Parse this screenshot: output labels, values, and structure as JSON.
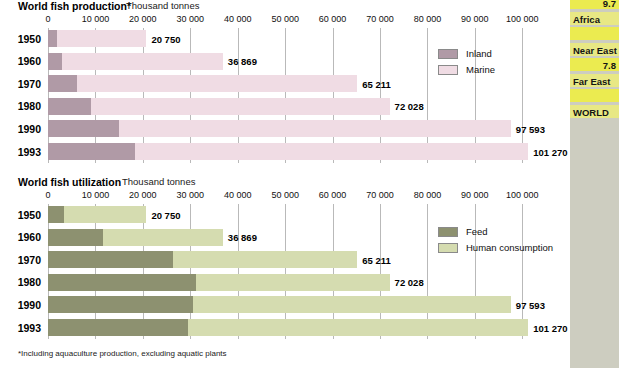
{
  "colors": {
    "inland": "#b09aa6",
    "marine": "#f0dce4",
    "feed": "#8d9170",
    "human_consumption": "#d5dcb0",
    "gridline": "#b9b9b9",
    "side_strip_bg": "#cdcdc0",
    "side_band": "#e8e884",
    "side_band_bright": "#ebeb50"
  },
  "footnote": "*Including aquaculture production, excluding aquatic plants",
  "axis": {
    "ticks": [
      "0",
      "10 000",
      "20 000",
      "30 000",
      "40 000",
      "50 000",
      "60 000",
      "70 000",
      "80 000",
      "90 000",
      "100 000"
    ],
    "min": 0,
    "max": 105000
  },
  "chart_data": [
    {
      "type": "bar",
      "orientation": "horizontal",
      "stacked": true,
      "title": "World fish production*",
      "subtitle": "Thousand tonnes",
      "xlabel": "Thousand tonnes",
      "ylabel": "",
      "xlim": [
        0,
        105000
      ],
      "grid": true,
      "legend_position": "inside-right",
      "categories": [
        "1950",
        "1960",
        "1970",
        "1980",
        "1990",
        "1993"
      ],
      "totals": [
        20750,
        36869,
        65211,
        72028,
        97593,
        101270
      ],
      "total_labels": [
        "20 750",
        "36 869",
        "65 211",
        "72 028",
        "97 593",
        "101 270"
      ],
      "series": [
        {
          "name": "Inland",
          "values": [
            2000,
            2900,
            6100,
            9000,
            14900,
            18400
          ]
        },
        {
          "name": "Marine",
          "values": [
            18750,
            33969,
            59111,
            63028,
            82693,
            82870
          ]
        }
      ]
    },
    {
      "type": "bar",
      "orientation": "horizontal",
      "stacked": true,
      "title": "World fish utilization",
      "subtitle": "Thousand tonnes",
      "xlabel": "Thousand tonnes",
      "ylabel": "",
      "xlim": [
        0,
        105000
      ],
      "grid": true,
      "legend_position": "inside-right",
      "categories": [
        "1950",
        "1960",
        "1970",
        "1980",
        "1990",
        "1993"
      ],
      "totals": [
        20750,
        36869,
        65211,
        72028,
        97593,
        101270
      ],
      "total_labels": [
        "20 750",
        "36 869",
        "65 211",
        "72 028",
        "97 593",
        "101 270"
      ],
      "series": [
        {
          "name": "Feed",
          "values": [
            3300,
            11500,
            26300,
            31300,
            30500,
            29500
          ]
        },
        {
          "name": "Human consumption",
          "values": [
            17450,
            25369,
            38911,
            40728,
            67093,
            71770
          ]
        }
      ]
    }
  ],
  "side_table": {
    "rows": [
      {
        "kind": "value",
        "text": "9.7"
      },
      {
        "kind": "label",
        "text": "Africa"
      },
      {
        "kind": "value",
        "text": ""
      },
      {
        "kind": "label",
        "text": "Near East"
      },
      {
        "kind": "value",
        "text": "7.8"
      },
      {
        "kind": "label",
        "text": "Far East"
      },
      {
        "kind": "value",
        "text": ""
      },
      {
        "kind": "label",
        "text": "WORLD"
      }
    ]
  }
}
